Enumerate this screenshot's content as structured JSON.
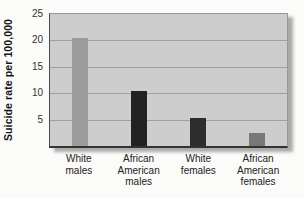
{
  "chart_data": {
    "type": "bar",
    "categories": [
      "White males",
      "African American males",
      "White females",
      "African American females"
    ],
    "values": [
      20.5,
      10.5,
      5.3,
      2.5
    ],
    "title": "",
    "xlabel": "",
    "ylabel": "Suicide rate per 100,000",
    "ylim": [
      0,
      25
    ],
    "yticks": [
      25,
      20,
      15,
      10,
      5
    ],
    "grid": true,
    "legend": "none",
    "bar_colors": [
      "#9c9c9c",
      "#222222",
      "#2d2d2d",
      "#787878"
    ],
    "plot_bg": "#cdcdcd"
  }
}
